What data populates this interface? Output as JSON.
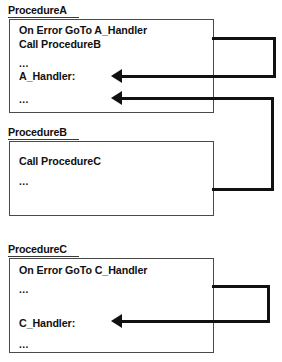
{
  "diagram": {
    "type": "error-handling-flow",
    "title_style": "underlined",
    "line_color": "#111111",
    "box_border_color": "#4a4a4a",
    "background": "#ffffff",
    "procedures": [
      {
        "name": "ProcedureA",
        "lines": [
          "On Error GoTo A_Handler",
          "Call ProcedureB",
          "...",
          "A_Handler:",
          "..."
        ]
      },
      {
        "name": "ProcedureB",
        "lines": [
          "Call ProcedureC",
          "..."
        ]
      },
      {
        "name": "ProcedureC",
        "lines": [
          "On Error GoTo C_Handler",
          "...",
          "C_Handler:",
          "..."
        ]
      }
    ],
    "connectors": [
      {
        "name": "a-handler-return",
        "from": "ProcedureA right edge",
        "to": "A_Handler: line",
        "arrow": "left"
      },
      {
        "name": "b-to-a-error-bubble",
        "from": "ProcedureB right edge",
        "to": "ProcedureA last line",
        "arrow": "left"
      },
      {
        "name": "c-handler-return",
        "from": "ProcedureC right edge",
        "to": "C_Handler: line",
        "arrow": "left"
      }
    ]
  }
}
